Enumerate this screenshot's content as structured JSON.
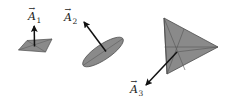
{
  "figure": {
    "background_color": "#ffffff",
    "shape_fill_color": "#8a8a8a",
    "shape_fill_color_light": "#9a9a9a",
    "shape_stroke_color": "#4a4a4a",
    "arrow_color": "#111111",
    "label_color": "#1a1a1a",
    "caption": "",
    "shapes": [
      {
        "id": "shape-1",
        "name": "flat-parallelogram",
        "kind": "parallelogram",
        "label": "A",
        "subscript": "1",
        "label_full": "A⃗1",
        "vector_direction": "up",
        "fill": "#8a8a8a"
      },
      {
        "id": "shape-2",
        "name": "tilted-ellipse-disk",
        "kind": "ellipse",
        "label": "A",
        "subscript": "2",
        "label_full": "A⃗2",
        "vector_direction": "up-left",
        "fill": "#8a8a8a"
      },
      {
        "id": "shape-3",
        "name": "large-triangle",
        "kind": "triangle",
        "label": "A",
        "subscript": "3",
        "label_full": "A⃗3",
        "vector_direction": "down-left",
        "fill": "#8a8a8a"
      }
    ],
    "labels": [
      {
        "id": "label-a1",
        "letter": "A",
        "subscript": "1",
        "x": 28,
        "y": 18
      },
      {
        "id": "label-a2",
        "letter": "A",
        "subscript": "2",
        "x": 64,
        "y": 19
      },
      {
        "id": "label-a3",
        "letter": "A",
        "subscript": "3",
        "x": 130,
        "y": 92
      }
    ]
  }
}
